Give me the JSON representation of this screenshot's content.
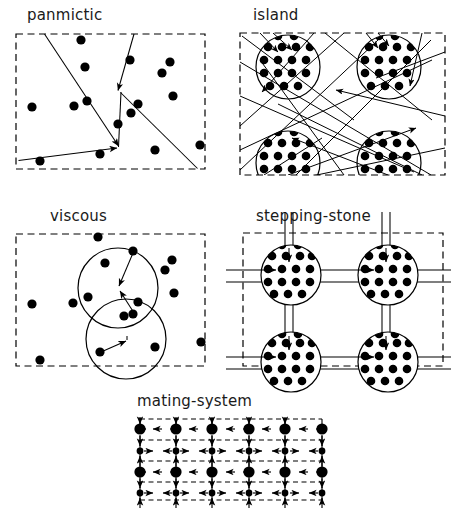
{
  "figure": {
    "width": 451,
    "height": 515,
    "background_color": "#ffffff",
    "ink_color": "#000000",
    "border_style": "dashed rectangle"
  },
  "panels": [
    {
      "id": "panmictic",
      "label": "panmictic",
      "label_pos": {
        "x": 27,
        "y": 8
      },
      "frame": {
        "x": 16,
        "y": 34,
        "w": 189,
        "h": 135
      },
      "description": "Single dashed boundary with scattered individuals and long straight mating lines converging on two arrowhead points; no sub-population circles.",
      "individuals": 18,
      "circles": 0,
      "lines": 5,
      "arrowheads": 2
    },
    {
      "id": "island",
      "label": "island",
      "label_pos": {
        "x": 253,
        "y": 8
      },
      "frame": {
        "x": 240,
        "y": 33,
        "w": 205,
        "h": 142
      },
      "description": "Four circular demes each packed with a dense grid of individuals; many long migration lines criss-cross the whole area, arrowheads entering every deme.",
      "demes": 4,
      "dots_per_deme": 21,
      "lines": 17,
      "arrowheads": 10
    },
    {
      "id": "viscous",
      "label": "viscous",
      "label_pos": {
        "x": 50,
        "y": 209
      },
      "frame": {
        "x": 16,
        "y": 234,
        "w": 189,
        "h": 132
      },
      "description": "Scattered individuals with two overlapping neighbourhood circles; short arrows converge to the centre of each circle.",
      "individuals": 18,
      "circles": 2,
      "arrowheads": 2
    },
    {
      "id": "stepping-stone",
      "label": "stepping-stone",
      "label_pos": {
        "x": 256,
        "y": 209
      },
      "frame": {
        "x": 243,
        "y": 233,
        "w": 200,
        "h": 133
      },
      "description": "Two-by-two lattice of circular demes filled with dot grids, connected to nearest neighbours only by paired parallel corridors carrying arrows.",
      "demes": 4,
      "dots_per_deme": 21,
      "corridor_pairs": 8,
      "arrowheads": 12
    },
    {
      "id": "mating-system",
      "label": "mating-system",
      "label_pos": {
        "x": 137,
        "y": 397
      },
      "frame": {
        "x": 140,
        "y": 419,
        "w": 182,
        "h": 81
      },
      "description": "Regular dashed lattice of territories: alternating rows of large dots (one sex) and small dots (the other), with short arrows along every lattice edge.",
      "grid_cols": 5,
      "grid_rows": 4,
      "large_dot_rows": [
        1,
        3
      ],
      "small_dot_rows": [
        2,
        4
      ]
    }
  ],
  "legend_notes": {
    "dot": "individual",
    "large_dot": "individual of one sex",
    "small_dot": "individual of other sex",
    "circle": "sub-population / neighbourhood",
    "line": "mating or migration event",
    "arrow": "direction of gene flow",
    "dashed_rectangle": "boundary of total population"
  }
}
